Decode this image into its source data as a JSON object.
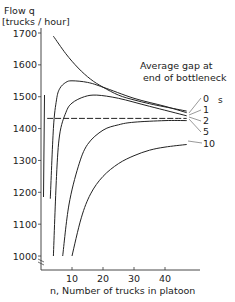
{
  "chart_data": {
    "type": "line",
    "title": "",
    "ylabel_line1": "Flow   q",
    "ylabel_line2": "[trucks / hour]",
    "xlabel": "n, Number of trucks in platoon",
    "annotation_line1": "Average gap at",
    "annotation_line2": "end of bottleneck",
    "unit_label": "s",
    "ylim": [
      970,
      1710
    ],
    "xlim": [
      0,
      50
    ],
    "yticks": [
      1000,
      1100,
      1200,
      1300,
      1400,
      1500,
      1600,
      1700
    ],
    "xticks": [
      10,
      20,
      30,
      40
    ],
    "grid": false,
    "series": [
      {
        "name": "0",
        "x": [
          4,
          8,
          12,
          16,
          20,
          25,
          30,
          35,
          40,
          47
        ],
        "values": [
          1690,
          1635,
          1590,
          1555,
          1530,
          1505,
          1490,
          1478,
          1468,
          1455
        ]
      },
      {
        "name": "1",
        "x": [
          3,
          4,
          5,
          6,
          8,
          10,
          15,
          20,
          30,
          40,
          47
        ],
        "values": [
          1180,
          1400,
          1490,
          1525,
          1545,
          1550,
          1545,
          1530,
          1495,
          1470,
          1450
        ]
      },
      {
        "name": "2",
        "x": [
          4,
          5,
          6,
          8,
          10,
          14,
          18,
          25,
          35,
          47
        ],
        "values": [
          1000,
          1250,
          1380,
          1450,
          1480,
          1500,
          1505,
          1495,
          1470,
          1440
        ]
      },
      {
        "name": "5",
        "x": [
          7,
          9,
          12,
          15,
          20,
          25,
          30,
          40,
          47
        ],
        "values": [
          1000,
          1160,
          1280,
          1350,
          1395,
          1412,
          1420,
          1425,
          1425
        ]
      },
      {
        "name": "10",
        "x": [
          10,
          13,
          16,
          20,
          25,
          30,
          35,
          40,
          47
        ],
        "values": [
          1000,
          1120,
          1195,
          1250,
          1290,
          1315,
          1332,
          1342,
          1350
        ]
      },
      {
        "name": "dashed-reference",
        "x": [
          2,
          47
        ],
        "values": [
          1432,
          1432
        ]
      }
    ],
    "curve_labels": [
      "0",
      "1",
      "2",
      "5",
      "10"
    ]
  }
}
